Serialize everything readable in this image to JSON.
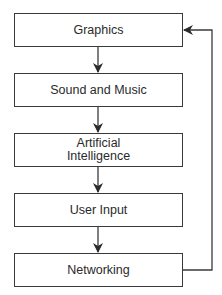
{
  "diagram": {
    "type": "flowchart",
    "direction": "top-to-bottom",
    "nodes": [
      {
        "id": "graphics",
        "label": "Graphics"
      },
      {
        "id": "sound",
        "label": "Sound and Music"
      },
      {
        "id": "ai",
        "label": "Artificial\nIntelligence",
        "lines": [
          "Artificial",
          "Intelligence"
        ]
      },
      {
        "id": "input",
        "label": "User Input"
      },
      {
        "id": "network",
        "label": "Networking"
      }
    ],
    "edges": [
      {
        "from": "graphics",
        "to": "sound"
      },
      {
        "from": "sound",
        "to": "ai"
      },
      {
        "from": "ai",
        "to": "input"
      },
      {
        "from": "input",
        "to": "network"
      },
      {
        "from": "network",
        "to": "graphics",
        "style": "feedback-loop-right"
      }
    ],
    "colors": {
      "stroke": "#3a3a3a",
      "text": "#2a2a2a",
      "background": "#ffffff"
    }
  }
}
